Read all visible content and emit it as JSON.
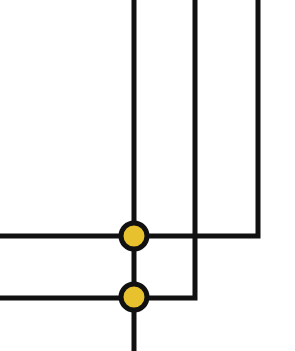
{
  "diagram": {
    "width": 295,
    "height": 351,
    "background": "#ffffff",
    "line_color": "#111111",
    "junction_fill": "#e8c22e",
    "junction_stroke": "#111111",
    "paths": [
      {
        "id": "line-a",
        "points": [
          [
            134,
            0
          ],
          [
            134,
            351
          ]
        ]
      },
      {
        "id": "line-b",
        "points": [
          [
            195,
            0
          ],
          [
            195,
            298
          ],
          [
            134,
            298
          ]
        ]
      },
      {
        "id": "line-c",
        "points": [
          [
            258,
            0
          ],
          [
            258,
            236
          ],
          [
            134,
            236
          ]
        ]
      },
      {
        "id": "line-d",
        "points": [
          [
            0,
            236
          ],
          [
            134,
            236
          ]
        ]
      },
      {
        "id": "line-e",
        "points": [
          [
            0,
            298
          ],
          [
            134,
            298
          ]
        ]
      }
    ],
    "junctions": [
      {
        "id": "junction-top",
        "cx": 134,
        "cy": 236
      },
      {
        "id": "junction-bottom",
        "cx": 134,
        "cy": 297
      }
    ]
  }
}
